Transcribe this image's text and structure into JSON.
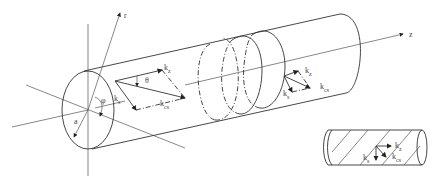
{
  "figure": {
    "axes": {
      "r": "r",
      "z": "z"
    },
    "labels": {
      "radius": "a",
      "angle_phi": "φ",
      "angle_theta": "θ",
      "k_z": "k",
      "k_z_sub": "z",
      "k_s": "k",
      "k_s_sub": "s",
      "k_cs": "k",
      "k_cs_sub": "cs"
    },
    "inset": {
      "k_z": "k",
      "k_z_sub": "z",
      "k_s": "k",
      "k_s_sub": "s",
      "k_cs": "k",
      "k_cs_sub": "cs"
    },
    "colors": {
      "line": "#333333",
      "background": "#ffffff"
    }
  }
}
